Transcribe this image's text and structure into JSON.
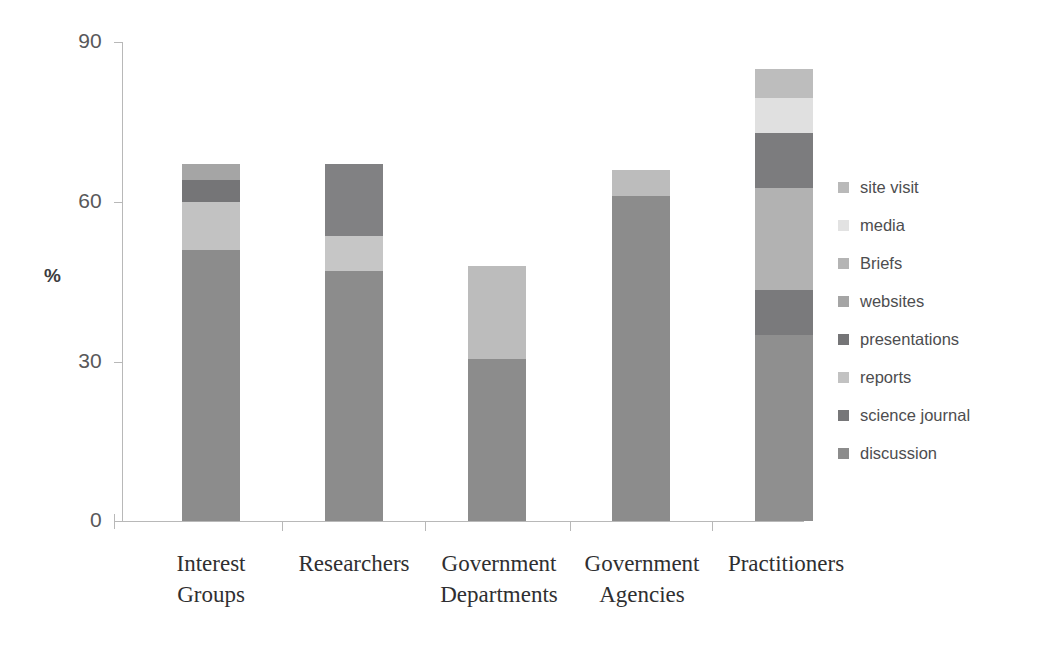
{
  "chart_data": {
    "type": "bar",
    "stacked": true,
    "title": "",
    "xlabel": "",
    "ylabel": "%",
    "ylim": [
      0,
      90
    ],
    "yticks": [
      0,
      30,
      60,
      90
    ],
    "grid": false,
    "legend_position": "right",
    "categories": [
      "Interest\nGroups",
      "Researchers",
      "Government\nDepartments",
      "Government\nAgencies",
      "Practitioners"
    ],
    "series": [
      {
        "name": "discussion",
        "color": "#8c8c8c",
        "values": [
          51.0,
          47.0,
          30.5,
          61.0,
          35.0
        ]
      },
      {
        "name": "science journal",
        "color": "#777779",
        "values": [
          0.0,
          13.5,
          0.0,
          0.0,
          8.5
        ]
      },
      {
        "name": "reports",
        "color": "#c2c2c2",
        "values": [
          9.0,
          0.0,
          17.5,
          5.0,
          19.0
        ]
      },
      {
        "name": "presentations",
        "color": "#757577",
        "values": [
          4.0,
          0.0,
          0.0,
          0.0,
          10.5
        ]
      },
      {
        "name": "websites",
        "color": "#a5a5a5",
        "values": [
          3.0,
          0.0,
          0.0,
          0.0,
          6.5
        ]
      },
      {
        "name": "Briefs",
        "color": "#b4b4b4",
        "values": [
          0.0,
          0.0,
          0.0,
          0.0,
          0.0
        ]
      },
      {
        "name": "media",
        "color": "#e2e2e2",
        "values": [
          0.0,
          6.5,
          0.0,
          0.0,
          0.0
        ]
      },
      {
        "name": "site visit",
        "color": "#b9b9b9",
        "values": [
          0.0,
          0.0,
          0.0,
          0.0,
          5.5
        ]
      }
    ],
    "totals": [
      67.0,
      67.0,
      48.0,
      66.0,
      85.0
    ]
  },
  "axes": {
    "y_title": "%",
    "y_tick_labels": [
      "90",
      "60",
      "30",
      "0"
    ]
  },
  "legend": {
    "items": [
      {
        "label": "site visit",
        "color": "#b9b9b9"
      },
      {
        "label": "media",
        "color": "#e2e2e2"
      },
      {
        "label": "Briefs",
        "color": "#b4b4b4"
      },
      {
        "label": "websites",
        "color": "#a5a5a5"
      },
      {
        "label": "presentations",
        "color": "#757577"
      },
      {
        "label": "reports",
        "color": "#c2c2c2"
      },
      {
        "label": "science journal",
        "color": "#777779"
      },
      {
        "label": "discussion",
        "color": "#8c8c8c"
      }
    ]
  },
  "bars": [
    {
      "category": "Interest\nGroups",
      "total": 67.0,
      "segments": [
        {
          "series": "discussion",
          "value": 51.0,
          "color": "#8c8c8c"
        },
        {
          "series": "reports",
          "value": 9.0,
          "color": "#c2c2c2"
        },
        {
          "series": "presentations",
          "value": 4.0,
          "color": "#757577"
        },
        {
          "series": "websites",
          "value": 3.0,
          "color": "#a5a5a5"
        }
      ]
    },
    {
      "category": "Researchers",
      "total": 67.0,
      "segments": [
        {
          "series": "discussion",
          "value": 47.0,
          "color": "#8c8c8c"
        },
        {
          "series": "media",
          "value": 6.5,
          "color": "#c6c6c6"
        },
        {
          "series": "science journal",
          "value": 13.5,
          "color": "#818183"
        }
      ]
    },
    {
      "category": "Government\nDepartments",
      "total": 48.0,
      "segments": [
        {
          "series": "discussion",
          "value": 30.5,
          "color": "#8c8c8c"
        },
        {
          "series": "reports",
          "value": 17.5,
          "color": "#bcbcbc"
        }
      ]
    },
    {
      "category": "Government\nAgencies",
      "total": 66.0,
      "segments": [
        {
          "series": "discussion",
          "value": 61.0,
          "color": "#8c8c8c"
        },
        {
          "series": "reports",
          "value": 5.0,
          "color": "#bcbcbc"
        }
      ]
    },
    {
      "category": "Practitioners",
      "total": 85.0,
      "segments": [
        {
          "series": "discussion",
          "value": 35.0,
          "color": "#8f8f8f"
        },
        {
          "series": "science journal",
          "value": 8.5,
          "color": "#7a7a7c"
        },
        {
          "series": "websites",
          "value": 19.0,
          "color": "#b2b2b2"
        },
        {
          "series": "presentations",
          "value": 10.5,
          "color": "#7c7c7e"
        },
        {
          "series": "media",
          "value": 6.5,
          "color": "#e0e0e0"
        },
        {
          "series": "site visit",
          "value": 5.5,
          "color": "#bdbdbd"
        }
      ]
    }
  ]
}
